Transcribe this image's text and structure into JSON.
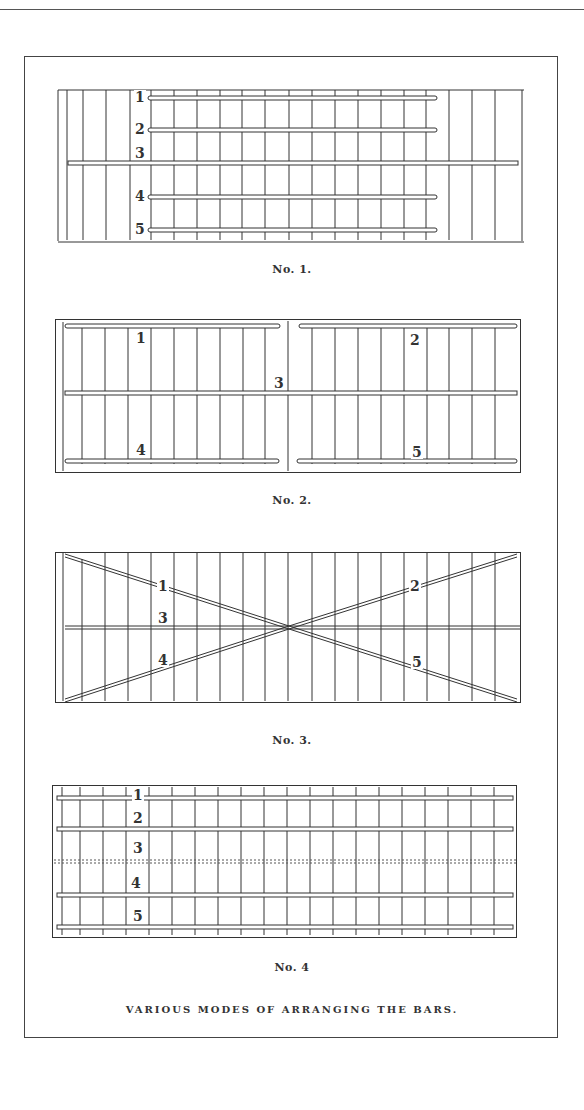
{
  "plate": {
    "title": "VARIOUS MODES OF ARRANGING THE BARS."
  },
  "figures": [
    {
      "caption": "No. 1.",
      "labels": [
        "1",
        "2",
        "3",
        "4",
        "5"
      ],
      "description": "Five horizontal bars; bars 1, 2, 4, 5 are short and span the middle section, bar 3 spans the full width"
    },
    {
      "caption": "No. 2.",
      "labels": [
        "1",
        "2",
        "3",
        "4",
        "5"
      ],
      "description": "Bars 1 and 2 along the top split at center, bar 3 full width across middle, bars 4 and 5 along the bottom split at center"
    },
    {
      "caption": "No. 3.",
      "labels": [
        "1",
        "2",
        "3",
        "4",
        "5"
      ],
      "description": "Bars 1, 2, 4, 5 run diagonally from corners to the center forming an X, bar 3 runs horizontally across the middle"
    },
    {
      "caption": "No. 4",
      "labels": [
        "1",
        "2",
        "3",
        "4",
        "5"
      ],
      "description": "Five full-width horizontal bars; bar 3 in the middle drawn dotted"
    }
  ],
  "colors": {
    "ink": "#333333",
    "paper": "#ffffff"
  }
}
